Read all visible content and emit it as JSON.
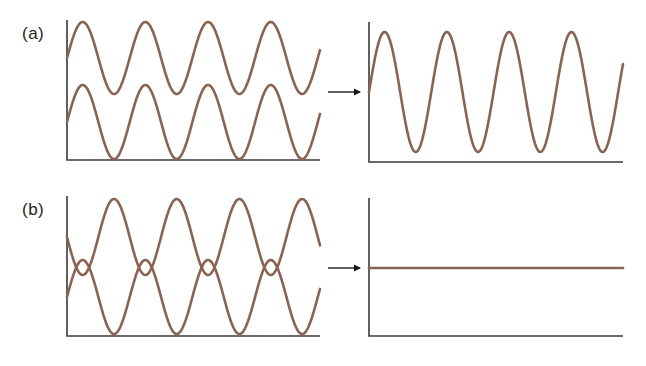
{
  "figure": {
    "colors": {
      "wave": "#8a6352",
      "axis": "#3a3a3a",
      "arrow": "#1a1a1a"
    },
    "panels": [
      {
        "label": "(a)",
        "description": "Two in-phase waves combine into one wave of larger amplitude (constructive interference)",
        "label_pos": [
          22,
          24
        ],
        "left": {
          "axis": {
            "x": 67,
            "y_top": 20,
            "y_bottom": 160,
            "x_end": 320
          },
          "waves": [
            {
              "name": "wave-1",
              "center": 58,
              "amp": 36,
              "phase": "sine",
              "x0": 67,
              "x1": 320,
              "period": 62.7
            },
            {
              "name": "wave-2",
              "center": 122,
              "amp": 37,
              "phase": "sine",
              "x0": 67,
              "x1": 320,
              "period": 62.7
            }
          ]
        },
        "arrow": {
          "x1": 328,
          "x2": 362,
          "y": 92
        },
        "right": {
          "axis": {
            "x": 369,
            "y_top": 22,
            "y_bottom": 162,
            "x_end": 623
          },
          "waves": [
            {
              "name": "sum-wave",
              "center": 92,
              "amp": 60,
              "phase": "sine",
              "x0": 369,
              "x1": 623,
              "period": 62.3
            }
          ]
        }
      },
      {
        "label": "(b)",
        "description": "Two out-of-phase waves cancel into a flat line (destructive interference)",
        "label_pos": [
          22,
          200
        ],
        "left": {
          "axis": {
            "x": 67,
            "y_top": 196,
            "y_bottom": 336,
            "x_end": 320
          },
          "waves": [
            {
              "name": "wave-1",
              "center": 237,
              "amp": 38,
              "phase": "inverted",
              "x0": 67,
              "x1": 320,
              "period": 62.7
            },
            {
              "name": "wave-2",
              "center": 297,
              "amp": 37,
              "phase": "sine",
              "x0": 67,
              "x1": 320,
              "period": 62.7
            }
          ]
        },
        "arrow": {
          "x1": 328,
          "x2": 362,
          "y": 268
        },
        "right": {
          "axis": {
            "x": 369,
            "y_top": 198,
            "y_bottom": 336,
            "x_end": 623
          },
          "waves": [
            {
              "name": "sum-flat",
              "center": 268,
              "amp": 0,
              "phase": "sine",
              "x0": 369,
              "x1": 623,
              "period": 62.3
            }
          ]
        }
      }
    ]
  }
}
